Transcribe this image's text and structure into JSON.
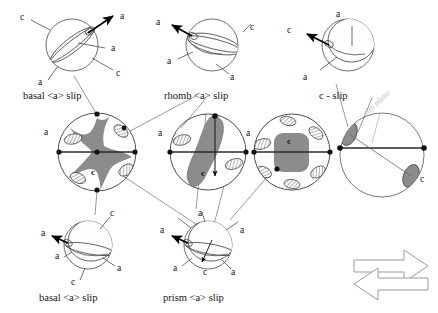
{
  "figure": {
    "background": "#ffffff",
    "line_color": "#3a3a3a",
    "gray_fill": "#8c8c8c",
    "light_gray": "#c3c3c3",
    "arrow_color": "#000000"
  },
  "captions": {
    "basal_top": "basal <a> slip",
    "rhomb": "rhomb <a> slip",
    "c_slip": "c - slip",
    "basal_bottom": "basal <a> slip",
    "prism": "prism <a> slip",
    "slip_plane": "slip plane"
  },
  "axis_labels": {
    "a": "a",
    "c": "c"
  },
  "crystals": [
    {
      "id": "basal-top",
      "name": "basal-a-slip-top",
      "caption": "basal <a> slip",
      "cx": 72,
      "cy": 45,
      "r": 26,
      "slip_arrow_dir": "up-right",
      "labels": [
        {
          "text": "a",
          "x": 122,
          "y": 16
        },
        {
          "text": "a",
          "x": 113,
          "y": 48
        },
        {
          "text": "c",
          "x": 20,
          "y": 17
        },
        {
          "text": "c",
          "x": 118,
          "y": 74
        },
        {
          "text": "a",
          "x": 38,
          "y": 81
        }
      ]
    },
    {
      "id": "rhomb",
      "name": "rhomb-a-slip",
      "caption": "rhomb <a> slip",
      "cx": 212,
      "cy": 45,
      "r": 26,
      "slip_arrow_dir": "up-left",
      "labels": [
        {
          "text": "a",
          "x": 158,
          "y": 22
        },
        {
          "text": "c",
          "x": 249,
          "y": 28
        },
        {
          "text": "a",
          "x": 168,
          "y": 61
        },
        {
          "text": "a",
          "x": 231,
          "y": 77
        }
      ]
    },
    {
      "id": "c-slip",
      "name": "c-slip",
      "caption": "c - slip",
      "cx": 348,
      "cy": 45,
      "r": 26,
      "slip_arrow_dir": "left",
      "labels": [
        {
          "text": "a",
          "x": 337,
          "y": 14
        },
        {
          "text": "c",
          "x": 288,
          "y": 30
        },
        {
          "text": "a",
          "x": 304,
          "y": 76
        }
      ]
    },
    {
      "id": "basal-bottom",
      "name": "basal-a-slip-bottom",
      "caption": "basal <a> slip",
      "cx": 88,
      "cy": 245,
      "r": 24,
      "slip_arrow_dir": "left",
      "labels": [
        {
          "text": "a",
          "x": 43,
          "y": 233
        },
        {
          "text": "c",
          "x": 105,
          "y": 212
        },
        {
          "text": "a",
          "x": 57,
          "y": 256
        },
        {
          "text": "a",
          "x": 119,
          "y": 268
        },
        {
          "text": "c",
          "x": 74,
          "y": 282
        }
      ]
    },
    {
      "id": "prism",
      "name": "prism-a-slip",
      "caption": "prism <a> slip",
      "cx": 208,
      "cy": 245,
      "r": 24,
      "slip_arrow_dir": "left",
      "labels": [
        {
          "text": "a",
          "x": 200,
          "y": 213
        },
        {
          "text": "a",
          "x": 162,
          "y": 230
        },
        {
          "text": "a",
          "x": 240,
          "y": 230
        },
        {
          "text": "a",
          "x": 175,
          "y": 268
        },
        {
          "text": "c",
          "x": 205,
          "y": 272
        },
        {
          "text": "a",
          "x": 232,
          "y": 272
        }
      ]
    }
  ],
  "pole_figures": [
    {
      "id": "pf1",
      "name": "pole-figure-basal",
      "cx": 97,
      "cy": 152,
      "r": 39,
      "center_label": "c",
      "edge_label": "a",
      "edge_label_x": 47,
      "edge_label_y": 139,
      "intensity_shape": "x-cross",
      "rim_lobes": 6
    },
    {
      "id": "pf2",
      "name": "pole-figure-rhomb",
      "cx": 208,
      "cy": 152,
      "r": 38,
      "center_label": "c",
      "edge_label": "a",
      "edge_label_x": 161,
      "edge_label_y": 139,
      "intensity_shape": "tilted-bar",
      "rim_lobes": 4
    },
    {
      "id": "pf3",
      "name": "pole-figure-prism",
      "cx": 292,
      "cy": 152,
      "r": 38,
      "center_label": "c",
      "edge_label": "a",
      "edge_label_x": 248,
      "edge_label_y": 139,
      "intensity_shape": "center-block",
      "rim_lobes": 6
    },
    {
      "id": "pf4",
      "name": "pole-figure-c-slip",
      "cx": 382,
      "cy": 155,
      "r": 42,
      "center_label": "c",
      "edge_label": "",
      "edge_label_x": 0,
      "edge_label_y": 0,
      "intensity_shape": "two-lobes",
      "rim_lobes": 2
    }
  ],
  "arrows": {
    "name": "double-block-arrow",
    "right_label": "",
    "left_label": "",
    "x": 352,
    "y": 248,
    "width": 78,
    "height": 52
  }
}
